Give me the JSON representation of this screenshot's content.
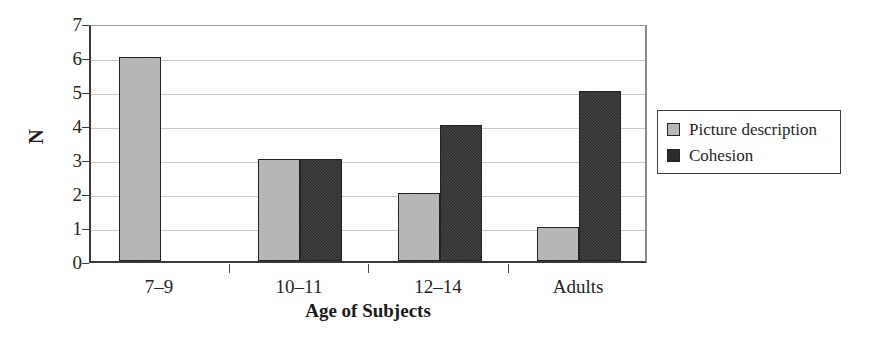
{
  "chart_data": {
    "type": "bar",
    "title": "",
    "subtitle": "",
    "xlabel": "Age of Subjects",
    "ylabel": "N",
    "categories": [
      "7–9",
      "10–11",
      "12–14",
      "Adults"
    ],
    "series": [
      {
        "name": "Picture description",
        "color": "#ababab",
        "values": [
          6,
          3,
          2,
          1
        ]
      },
      {
        "name": "Cohesion",
        "color": "#2b2b2b",
        "values": [
          0,
          3,
          4,
          5
        ]
      }
    ],
    "ylim": [
      0,
      7
    ],
    "ytick_labels": [
      "0",
      "1",
      "2",
      "3",
      "4",
      "5",
      "6",
      "7"
    ],
    "ytick_values": [
      0,
      1,
      2,
      3,
      4,
      5,
      6,
      7
    ],
    "grid": "horizontal",
    "legend_position": "right-outside",
    "legend_entries": [
      "Picture description",
      "Cohesion"
    ],
    "annotations": []
  }
}
